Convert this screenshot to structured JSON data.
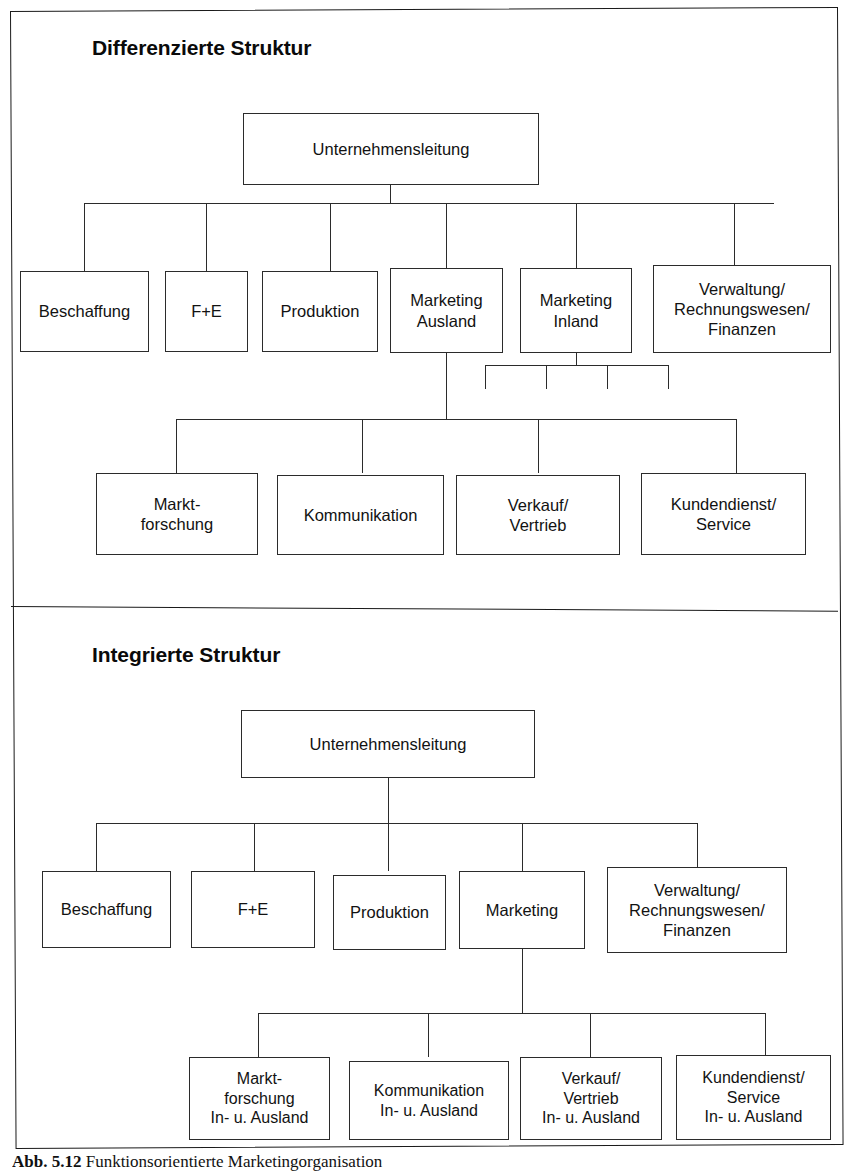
{
  "figure": {
    "caption_number": "Abb. 5.12",
    "caption_text": "Funktionsorientierte Marketingorganisation"
  },
  "panels": [
    {
      "id": "differenzierte-struktur",
      "heading": "Differenzierte Struktur",
      "root": {
        "label": "Unternehmensleitung"
      },
      "level1": [
        {
          "label": "Beschaffung"
        },
        {
          "label": "F+E"
        },
        {
          "label": "Produktion"
        },
        {
          "label_line1": "Marketing",
          "label_line2": "Ausland"
        },
        {
          "label_line1": "Marketing",
          "label_line2": "Inland"
        },
        {
          "label_line1": "Verwaltung/",
          "label_line2": "Rechnungswesen/",
          "label_line3": "Finanzen"
        }
      ],
      "level2_parent": "Marketing Ausland",
      "level2": [
        {
          "label_line1": "Markt-",
          "label_line2": "forschung"
        },
        {
          "label_line1": "Kommunikation"
        },
        {
          "label_line1": "Verkauf/",
          "label_line2": "Vertrieb"
        },
        {
          "label_line1": "Kundendienst/",
          "label_line2": "Service"
        }
      ],
      "inland_stub_branches": 4
    },
    {
      "id": "integrierte-struktur",
      "heading": "Integrierte Struktur",
      "root": {
        "label": "Unternehmensleitung"
      },
      "level1": [
        {
          "label": "Beschaffung"
        },
        {
          "label": "F+E"
        },
        {
          "label": "Produktion"
        },
        {
          "label": "Marketing"
        },
        {
          "label_line1": "Verwaltung/",
          "label_line2": "Rechnungswesen/",
          "label_line3": "Finanzen"
        }
      ],
      "level2_parent": "Marketing",
      "level2": [
        {
          "label_line1": "Markt-",
          "label_line2": "forschung",
          "label_line3": "In- u. Ausland"
        },
        {
          "label_line1": "Kommunikation",
          "label_line2": "In- u. Ausland"
        },
        {
          "label_line1": "Verkauf/",
          "label_line2": "Vertrieb",
          "label_line3": "In- u. Ausland"
        },
        {
          "label_line1": "Kundendienst/",
          "label_line2": "Service",
          "label_line3": "In- u. Ausland"
        }
      ]
    }
  ],
  "colors": {
    "ink": "#1a1a1a",
    "box_border": "#2b2b2b",
    "paper": "#ffffff"
  }
}
